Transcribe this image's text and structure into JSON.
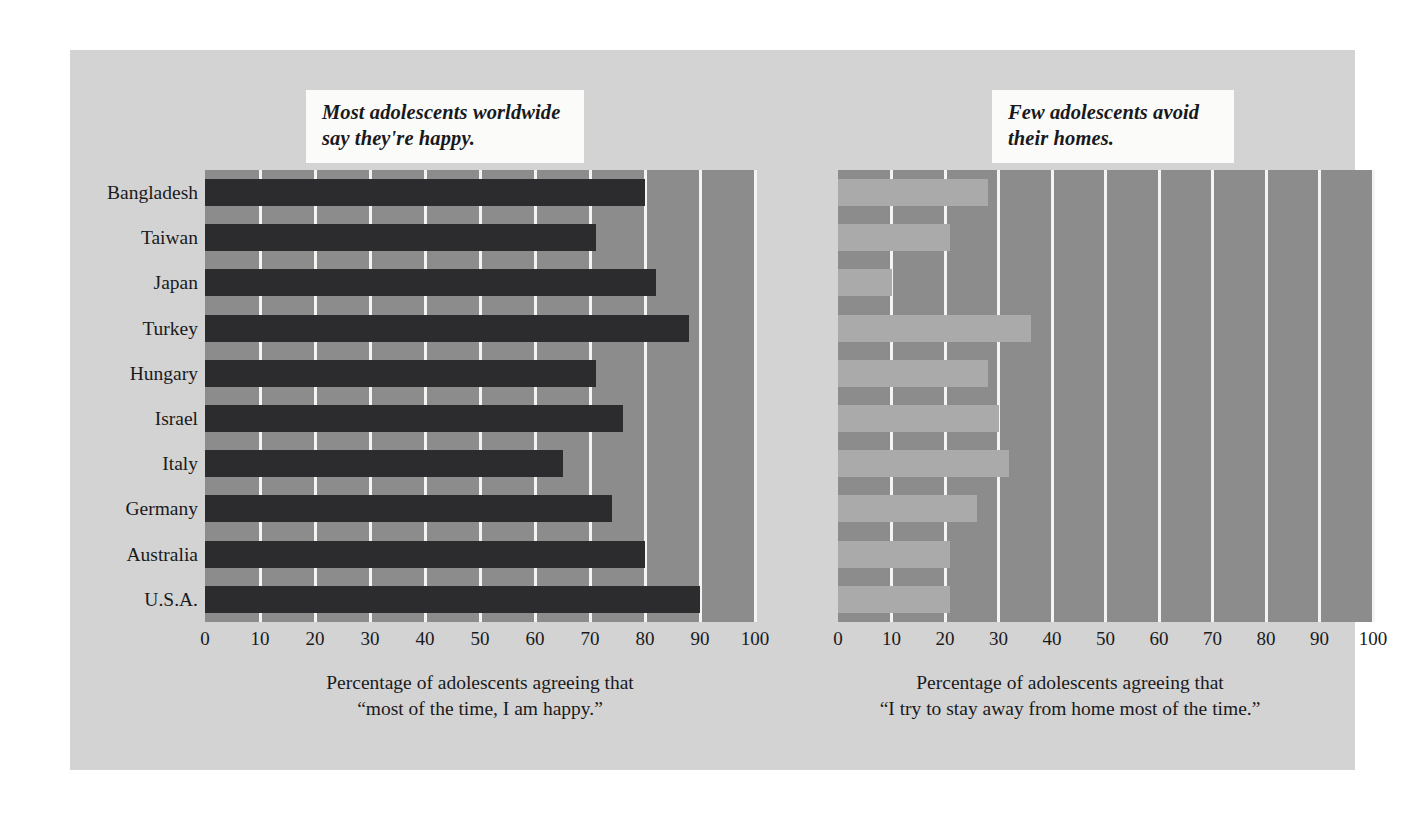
{
  "figure": {
    "background_color": "#d3d3d3",
    "page_background": "#ffffff"
  },
  "chart_data": [
    {
      "type": "bar",
      "orientation": "horizontal",
      "panel": "left",
      "title": "Most adolescents worldwide\nsay they're happy.",
      "xlabel": "Percentage of adolescents agreeing that\n“most of the time, I am happy.”",
      "ylabel": "",
      "categories": [
        "Bangladesh",
        "Taiwan",
        "Japan",
        "Turkey",
        "Hungary",
        "Israel",
        "Italy",
        "Germany",
        "Australia",
        "U.S.A."
      ],
      "values": [
        80,
        71,
        82,
        88,
        71,
        76,
        65,
        74,
        80,
        90
      ],
      "xlim": [
        0,
        100
      ],
      "ticks": [
        "0",
        "10",
        "20",
        "30",
        "40",
        "50",
        "60",
        "70",
        "80",
        "90",
        "100"
      ],
      "tick_values": [
        0,
        10,
        20,
        30,
        40,
        50,
        60,
        70,
        80,
        90,
        100
      ],
      "grid": true,
      "legend": "none",
      "bar_color": "#2c2c2e",
      "plot_background": "#8c8c8c",
      "gridline_color": "#f4f4f2"
    },
    {
      "type": "bar",
      "orientation": "horizontal",
      "panel": "right",
      "title": "Few adolescents avoid\ntheir homes.",
      "xlabel": "Percentage of adolescents agreeing that\n“I try to stay away from home most of the time.”",
      "ylabel": "",
      "categories": [
        "Bangladesh",
        "Taiwan",
        "Japan",
        "Turkey",
        "Hungary",
        "Israel",
        "Italy",
        "Germany",
        "Australia",
        "U.S.A."
      ],
      "values": [
        28,
        21,
        10,
        36,
        28,
        30,
        32,
        26,
        21,
        21
      ],
      "xlim": [
        0,
        100
      ],
      "ticks": [
        "0",
        "10",
        "20",
        "30",
        "40",
        "50",
        "60",
        "70",
        "80",
        "90",
        "100"
      ],
      "tick_values": [
        0,
        10,
        20,
        30,
        40,
        50,
        60,
        70,
        80,
        90,
        100
      ],
      "grid": true,
      "legend": "none",
      "bar_color": "#aaaaaa",
      "plot_background": "#8c8c8c",
      "gridline_color": "#f4f4f2"
    }
  ]
}
